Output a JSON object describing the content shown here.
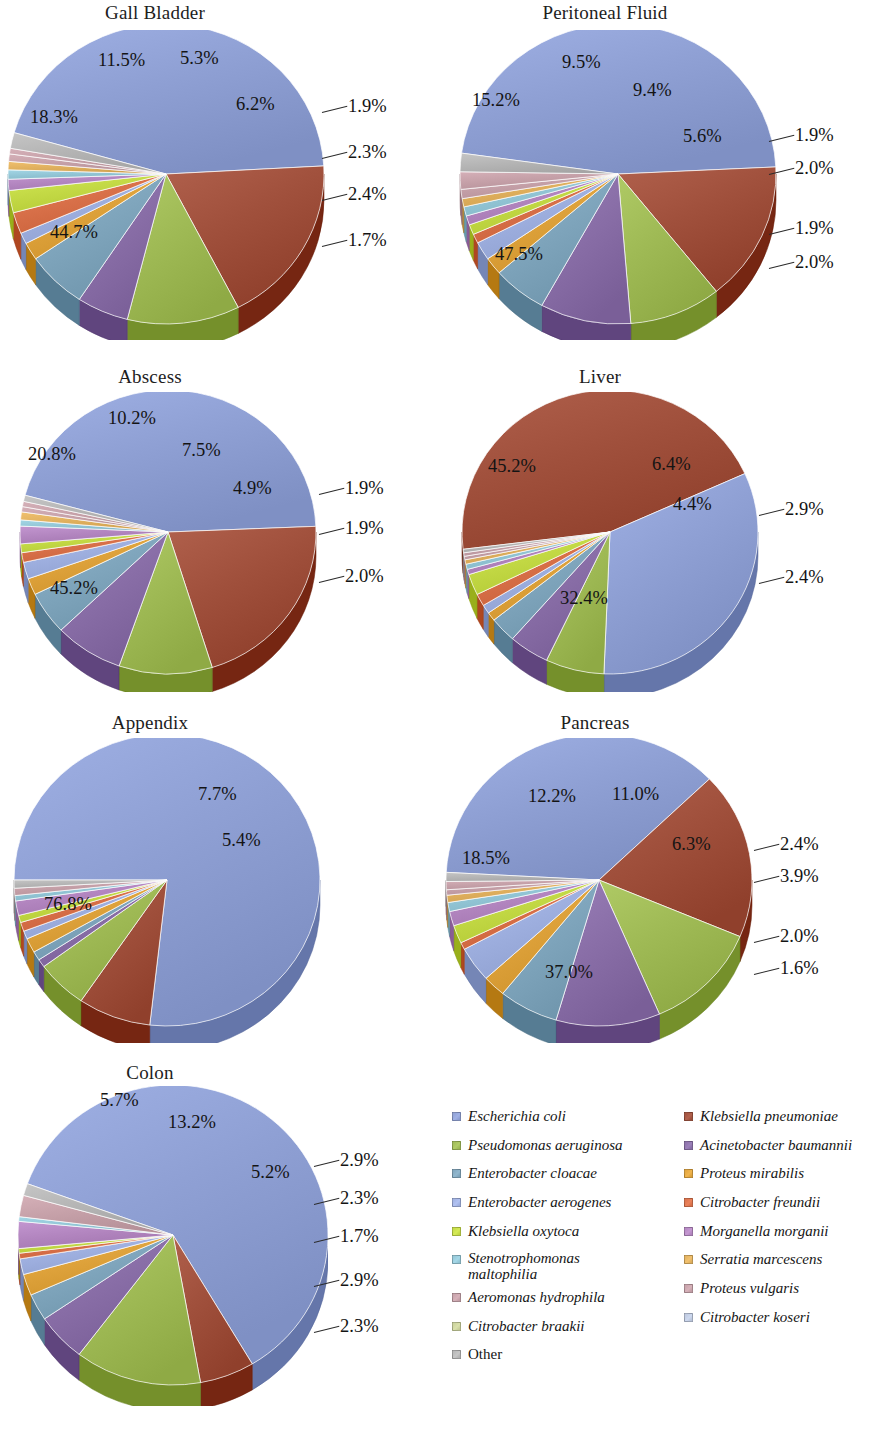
{
  "figure": {
    "type": "pie-grid",
    "organism_count": 15
  },
  "palette": {
    "escherichia_coli": "#8münch",
    "colors": [
      "#8fa0d4",
      "#a0503c",
      "#9fba55",
      "#8a6fa8",
      "#80a6bd",
      "#dfa33c",
      "#9fb0e0",
      "#d9714a",
      "#c3d945",
      "#b386c0",
      "#93c6d6",
      "#e0b05e",
      "#c5a0a8",
      "#bcc7dd",
      "#b5b5b5"
    ]
  },
  "legend": {
    "columns": [
      {
        "items": [
          {
            "label": "Escherichia coli",
            "color": "#8fa0d4",
            "italic": true
          },
          {
            "label": "Pseudomonas aeruginosa",
            "color": "#9fba55",
            "italic": true
          },
          {
            "label": "Enterobacter cloacae",
            "color": "#80a6bd",
            "italic": true
          },
          {
            "label": "Enterobacter aerogenes",
            "color": "#9fb0e0",
            "italic": true
          },
          {
            "label": "Klebsiella oxytoca",
            "color": "#c3d945",
            "italic": true
          },
          {
            "label": "Stenotrophomonas maltophilia",
            "color": "#93c6d6",
            "italic": true
          },
          {
            "label": "Aeromonas hydrophila",
            "color": "#c5a0a8",
            "italic": true
          },
          {
            "label": "Citrobacter braakii",
            "color": "#c8cf9a",
            "italic": true
          },
          {
            "label": "Other",
            "color": "#b5b5b5",
            "italic": false
          }
        ]
      },
      {
        "items": [
          {
            "label": "Klebsiella pneumoniae",
            "color": "#a0503c",
            "italic": true
          },
          {
            "label": "Acinetobacter baumannii",
            "color": "#8a6fa8",
            "italic": true
          },
          {
            "label": "Proteus mirabilis",
            "color": "#dfa33c",
            "italic": true
          },
          {
            "label": "Citrobacter freundii",
            "color": "#d9714a",
            "italic": true
          },
          {
            "label": "Morganella morganii",
            "color": "#b386c0",
            "italic": true
          },
          {
            "label": "Serratia marcescens",
            "color": "#e0b05e",
            "italic": true
          },
          {
            "label": "Proteus vulgaris",
            "color": "#c5a0a8",
            "italic": true
          },
          {
            "label": "Citrobacter koseri",
            "color": "#bcc7dd",
            "italic": true
          }
        ]
      }
    ]
  },
  "chart_data": [
    {
      "type": "pie",
      "title": "Gall Bladder",
      "categories": [
        "Escherichia coli",
        "Klebsiella pneumoniae",
        "Pseudomonas aeruginosa",
        "Acinetobacter baumannii",
        "Enterobacter cloacae",
        "Proteus mirabilis",
        "Enterobacter aerogenes",
        "Citrobacter freundii",
        "Klebsiella oxytoca",
        "Morganella morganii",
        "Stenotrophomonas maltophilia",
        "Serratia marcescens",
        "Aeromonas hydrophila",
        "Proteus vulgaris",
        "Other"
      ],
      "values": [
        44.7,
        18.3,
        11.5,
        5.3,
        6.2,
        1.9,
        1.2,
        2.3,
        2.4,
        1.2,
        1.0,
        0.9,
        0.8,
        0.6,
        1.7
      ],
      "labels_shown": [
        "44.7%",
        "18.3%",
        "11.5%",
        "5.3%",
        "6.2%",
        "1.9%",
        "2.3%",
        "2.4%",
        "1.7%"
      ]
    },
    {
      "type": "pie",
      "title": "Peritoneal Fluid",
      "categories": [
        "Escherichia coli",
        "Klebsiella pneumoniae",
        "Pseudomonas aeruginosa",
        "Acinetobacter baumannii",
        "Enterobacter cloacae",
        "Proteus mirabilis",
        "Enterobacter aerogenes",
        "Citrobacter freundii",
        "Klebsiella oxytoca",
        "Morganella morganii",
        "Stenotrophomonas maltophilia",
        "Serratia marcescens",
        "Aeromonas hydrophila",
        "Proteus vulgaris",
        "Other"
      ],
      "values": [
        47.5,
        15.2,
        9.5,
        9.4,
        5.6,
        1.9,
        2.0,
        1.0,
        1.1,
        1.0,
        1.0,
        0.9,
        1.0,
        1.9,
        2.0
      ],
      "labels_shown": [
        "47.5%",
        "15.2%",
        "9.5%",
        "9.4%",
        "5.6%",
        "1.9%",
        "2.0%",
        "1.9%",
        "2.0%"
      ]
    },
    {
      "type": "pie",
      "title": "Abscess",
      "categories": [
        "Escherichia coli",
        "Klebsiella pneumoniae",
        "Pseudomonas aeruginosa",
        "Acinetobacter baumannii",
        "Enterobacter cloacae",
        "Proteus mirabilis",
        "Enterobacter aerogenes",
        "Citrobacter freundii",
        "Klebsiella oxytoca",
        "Morganella morganii",
        "Stenotrophomonas maltophilia",
        "Serratia marcescens",
        "Aeromonas hydrophila",
        "Proteus vulgaris",
        "Other"
      ],
      "values": [
        45.2,
        20.8,
        10.2,
        7.5,
        4.9,
        1.9,
        1.9,
        1.1,
        1.0,
        2.0,
        0.7,
        0.9,
        0.6,
        0.6,
        0.7
      ],
      "labels_shown": [
        "45.2%",
        "20.8%",
        "10.2%",
        "7.5%",
        "4.9%",
        "1.9%",
        "1.9%",
        "2.0%"
      ]
    },
    {
      "type": "pie",
      "title": "Liver",
      "categories": [
        "Klebsiella pneumoniae",
        "Escherichia coli",
        "Pseudomonas aeruginosa",
        "Acinetobacter baumannii",
        "Enterobacter cloacae",
        "Proteus mirabilis",
        "Enterobacter aerogenes",
        "Citrobacter freundii",
        "Klebsiella oxytoca",
        "Morganella morganii",
        "Stenotrophomonas maltophilia",
        "Serratia marcescens",
        "Aeromonas hydrophila",
        "Proteus vulgaris",
        "Other"
      ],
      "values": [
        45.2,
        32.4,
        6.4,
        4.4,
        2.9,
        1.0,
        1.0,
        1.4,
        2.4,
        0.6,
        0.6,
        0.5,
        0.4,
        0.4,
        0.4
      ],
      "labels_shown": [
        "45.2%",
        "32.4%",
        "6.4%",
        "4.4%",
        "2.9%",
        "2.4%"
      ]
    },
    {
      "type": "pie",
      "title": "Appendix",
      "categories": [
        "Escherichia coli",
        "Klebsiella pneumoniae",
        "Pseudomonas aeruginosa",
        "Acinetobacter baumannii",
        "Enterobacter cloacae",
        "Proteus mirabilis",
        "Enterobacter aerogenes",
        "Citrobacter freundii",
        "Klebsiella oxytoca",
        "Morganella morganii",
        "Stenotrophomonas maltophilia",
        "Aeromonas hydrophila",
        "Other"
      ],
      "values": [
        76.8,
        7.7,
        5.4,
        0.9,
        1.0,
        1.6,
        0.9,
        1.0,
        0.8,
        1.6,
        0.6,
        0.8,
        0.9
      ],
      "labels_shown": [
        "76.8%",
        "7.7%",
        "5.4%"
      ]
    },
    {
      "type": "pie",
      "title": "Pancreas",
      "categories": [
        "Escherichia coli",
        "Klebsiella pneumoniae",
        "Pseudomonas aeruginosa",
        "Acinetobacter baumannii",
        "Enterobacter cloacae",
        "Proteus mirabilis",
        "Enterobacter aerogenes",
        "Citrobacter freundii",
        "Klebsiella oxytoca",
        "Morganella morganii",
        "Stenotrophomonas maltophilia",
        "Serratia marcescens",
        "Aeromonas hydrophila",
        "Proteus vulgaris",
        "Other"
      ],
      "values": [
        37.0,
        18.5,
        12.2,
        11.0,
        6.3,
        2.4,
        3.9,
        0.8,
        2.0,
        1.6,
        1.0,
        0.8,
        0.6,
        0.9,
        1.0
      ],
      "labels_shown": [
        "37.0%",
        "18.5%",
        "12.2%",
        "11.0%",
        "6.3%",
        "2.4%",
        "3.9%",
        "2.0%",
        "1.6%"
      ]
    },
    {
      "type": "pie",
      "title": "Colon",
      "categories": [
        "Escherichia coli",
        "Klebsiella pneumoniae",
        "Pseudomonas aeruginosa",
        "Acinetobacter baumannii",
        "Enterobacter cloacae",
        "Proteus mirabilis",
        "Enterobacter aerogenes",
        "Citrobacter freundii",
        "Klebsiella oxytoca",
        "Morganella morganii",
        "Stenotrophomonas maltophilia",
        "Aeromonas hydrophila",
        "Other"
      ],
      "values": [
        60.9,
        5.7,
        13.2,
        5.2,
        2.9,
        2.3,
        1.7,
        0.6,
        0.5,
        2.9,
        0.5,
        2.3,
        1.3
      ],
      "labels_shown": [
        "60.9%",
        "5.7%",
        "13.2%",
        "5.2%",
        "2.9%",
        "2.3%",
        "1.7%",
        "2.9%",
        "2.3%"
      ]
    }
  ],
  "charts": [
    {
      "id": "gall-bladder",
      "title": "Gall Bladder",
      "labels": [
        {
          "text": "11.5%",
          "x": 98,
          "y": 48
        },
        {
          "text": "5.3%",
          "x": 180,
          "y": 46
        },
        {
          "text": "6.2%",
          "x": 236,
          "y": 92
        },
        {
          "text": "1.9%",
          "x": 348,
          "y": 94
        },
        {
          "text": "18.3%",
          "x": 30,
          "y": 105
        },
        {
          "text": "2.3%",
          "x": 348,
          "y": 140
        },
        {
          "text": "2.4%",
          "x": 348,
          "y": 182
        },
        {
          "text": "1.7%",
          "x": 348,
          "y": 228
        },
        {
          "text": "44.7%",
          "x": 50,
          "y": 220
        }
      ]
    },
    {
      "id": "peritoneal-fluid",
      "title": "Peritoneal Fluid",
      "labels": [
        {
          "text": "9.5%",
          "x": 122,
          "y": 50
        },
        {
          "text": "9.4%",
          "x": 193,
          "y": 78
        },
        {
          "text": "15.2%",
          "x": 32,
          "y": 88
        },
        {
          "text": "5.6%",
          "x": 243,
          "y": 124
        },
        {
          "text": "1.9%",
          "x": 355,
          "y": 123
        },
        {
          "text": "2.0%",
          "x": 355,
          "y": 156
        },
        {
          "text": "1.9%",
          "x": 355,
          "y": 216
        },
        {
          "text": "2.0%",
          "x": 355,
          "y": 250
        },
        {
          "text": "47.5%",
          "x": 55,
          "y": 242
        }
      ]
    },
    {
      "id": "abscess",
      "title": "Abscess",
      "labels": [
        {
          "text": "10.2%",
          "x": 108,
          "y": 42
        },
        {
          "text": "7.5%",
          "x": 182,
          "y": 74
        },
        {
          "text": "20.8%",
          "x": 28,
          "y": 78
        },
        {
          "text": "4.9%",
          "x": 233,
          "y": 112
        },
        {
          "text": "1.9%",
          "x": 345,
          "y": 112
        },
        {
          "text": "1.9%",
          "x": 345,
          "y": 152
        },
        {
          "text": "2.0%",
          "x": 345,
          "y": 200
        },
        {
          "text": "45.2%",
          "x": 50,
          "y": 212
        }
      ]
    },
    {
      "id": "liver",
      "title": "Liver",
      "labels": [
        {
          "text": "45.2%",
          "x": 48,
          "y": 90
        },
        {
          "text": "6.4%",
          "x": 212,
          "y": 88
        },
        {
          "text": "4.4%",
          "x": 233,
          "y": 128
        },
        {
          "text": "2.9%",
          "x": 345,
          "y": 133
        },
        {
          "text": "2.4%",
          "x": 345,
          "y": 201
        },
        {
          "text": "32.4%",
          "x": 120,
          "y": 222
        }
      ]
    },
    {
      "id": "appendix",
      "title": "Appendix",
      "labels": [
        {
          "text": "7.7%",
          "x": 198,
          "y": 72
        },
        {
          "text": "5.4%",
          "x": 222,
          "y": 118
        },
        {
          "text": "76.8%",
          "x": 44,
          "y": 182
        }
      ]
    },
    {
      "id": "pancreas",
      "title": "Pancreas",
      "labels": [
        {
          "text": "12.2%",
          "x": 88,
          "y": 74
        },
        {
          "text": "11.0%",
          "x": 172,
          "y": 72
        },
        {
          "text": "18.5%",
          "x": 22,
          "y": 136
        },
        {
          "text": "6.3%",
          "x": 232,
          "y": 122
        },
        {
          "text": "2.4%",
          "x": 340,
          "y": 122
        },
        {
          "text": "3.9%",
          "x": 340,
          "y": 154
        },
        {
          "text": "2.0%",
          "x": 340,
          "y": 214
        },
        {
          "text": "1.6%",
          "x": 340,
          "y": 246
        },
        {
          "text": "37.0%",
          "x": 105,
          "y": 250
        }
      ]
    },
    {
      "id": "colon",
      "title": "Colon",
      "labels": [
        {
          "text": "5.7%",
          "x": 100,
          "y": 28
        },
        {
          "text": "13.2%",
          "x": 168,
          "y": 50
        },
        {
          "text": "5.2%",
          "x": 251,
          "y": 100
        },
        {
          "text": "2.9%",
          "x": 340,
          "y": 88
        },
        {
          "text": "2.3%",
          "x": 340,
          "y": 126
        },
        {
          "text": "1.7%",
          "x": 340,
          "y": 164
        },
        {
          "text": "2.9%",
          "x": 340,
          "y": 208
        },
        {
          "text": "2.3%",
          "x": 340,
          "y": 254
        }
      ]
    }
  ]
}
